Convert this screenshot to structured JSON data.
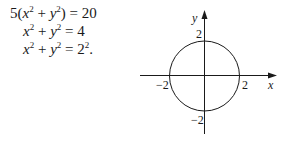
{
  "equations": {
    "line1": {
      "coef": "5(",
      "x": "x",
      "x_exp": "2",
      "plus": " + ",
      "y": "y",
      "y_exp": "2",
      "close": ")",
      "eq": " = ",
      "rhs": "20"
    },
    "line2": {
      "x": "x",
      "x_exp": "2",
      "plus": " + ",
      "y": "y",
      "y_exp": "2",
      "eq": " = ",
      "rhs": "4"
    },
    "line3": {
      "x": "x",
      "x_exp": "2",
      "plus": " + ",
      "y": "y",
      "y_exp": "2",
      "eq": " = ",
      "rhs_base": "2",
      "rhs_exp": "2",
      "end": "."
    }
  },
  "graph": {
    "x_axis_label": "x",
    "y_axis_label": "y",
    "tick_labels": {
      "x_pos": "2",
      "x_neg": "−2",
      "y_pos": "2",
      "y_neg": "−2"
    },
    "circle": {
      "center": [
        0,
        0
      ],
      "radius": 2
    },
    "line_color": "#1a1a1a"
  }
}
